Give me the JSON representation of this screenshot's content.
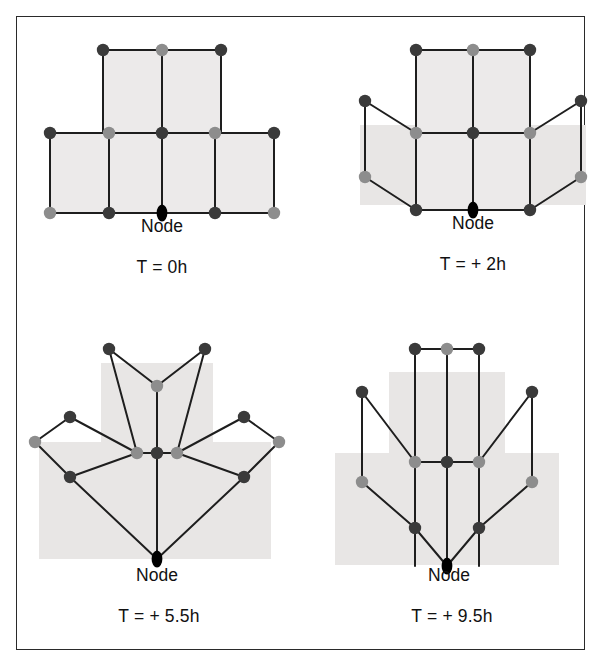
{
  "figure": {
    "border_color": "#2a2a2a",
    "background": "#ffffff"
  },
  "style": {
    "node_dark": "#3a3a3a",
    "node_light": "#8d8d8d",
    "node_black": "#000000",
    "edge_color": "#1e1e1e",
    "cell_fill": "#eceaea",
    "band_fill": "#e8e6e5",
    "node_radius": 6.2,
    "edge_width": 2.0
  },
  "panels": [
    {
      "id": "panel-t0",
      "caption": "T = 0h",
      "node_label": "Node",
      "origin_node": "n_origin",
      "faces": [
        {
          "name": "face-top-left",
          "points": "86,33 145,33 145,116 86,116"
        },
        {
          "name": "face-top-right",
          "points": "145,33 204,33 204,116 145,116"
        },
        {
          "name": "face-mid-left",
          "points": "33,116 92,116 92,196 33,196"
        },
        {
          "name": "face-mid-centerleft",
          "points": "92,116 145,116 145,196 92,196"
        },
        {
          "name": "face-mid-centerright",
          "points": "145,116 198,116 198,196 145,196"
        },
        {
          "name": "face-mid-right",
          "points": "198,116 257,116 257,196 198,196"
        }
      ],
      "bands": [],
      "edges": [
        [
          86,
          33,
          145,
          33
        ],
        [
          145,
          33,
          204,
          33
        ],
        [
          86,
          33,
          86,
          116
        ],
        [
          145,
          33,
          145,
          116
        ],
        [
          204,
          33,
          204,
          116
        ],
        [
          33,
          116,
          92,
          116
        ],
        [
          92,
          116,
          145,
          116
        ],
        [
          145,
          116,
          198,
          116
        ],
        [
          198,
          116,
          257,
          116
        ],
        [
          33,
          116,
          33,
          196
        ],
        [
          92,
          116,
          92,
          196
        ],
        [
          145,
          116,
          145,
          196
        ],
        [
          198,
          116,
          198,
          196
        ],
        [
          257,
          116,
          257,
          196
        ],
        [
          33,
          196,
          92,
          196
        ],
        [
          92,
          196,
          145,
          196
        ],
        [
          145,
          196,
          198,
          196
        ],
        [
          198,
          196,
          257,
          196
        ]
      ],
      "nodes": [
        {
          "x": 86,
          "y": 33,
          "tone": "dark"
        },
        {
          "x": 145,
          "y": 33,
          "tone": "light"
        },
        {
          "x": 204,
          "y": 33,
          "tone": "dark"
        },
        {
          "x": 33,
          "y": 116,
          "tone": "dark"
        },
        {
          "x": 92,
          "y": 116,
          "tone": "light"
        },
        {
          "x": 145,
          "y": 116,
          "tone": "dark"
        },
        {
          "x": 198,
          "y": 116,
          "tone": "light"
        },
        {
          "x": 257,
          "y": 116,
          "tone": "dark"
        },
        {
          "x": 33,
          "y": 196,
          "tone": "light"
        },
        {
          "x": 92,
          "y": 196,
          "tone": "dark"
        },
        {
          "x": 145,
          "y": 196,
          "tone": "black"
        },
        {
          "x": 198,
          "y": 196,
          "tone": "dark"
        },
        {
          "x": 257,
          "y": 196,
          "tone": "light"
        }
      ]
    },
    {
      "id": "panel-t2",
      "caption": "T = + 2h",
      "node_label": "Node",
      "origin_node": "n_origin",
      "faces": [
        {
          "name": "face-top-left",
          "points": "113,33 170,33 170,116 113,116"
        },
        {
          "name": "face-top-right",
          "points": "170,33 227,33 227,116 170,116"
        },
        {
          "name": "face-mid-left",
          "points": "113,116 170,116 170,193 113,193"
        },
        {
          "name": "face-mid-right",
          "points": "170,116 227,116 227,193 170,193"
        }
      ],
      "bands": [
        {
          "name": "band-lower",
          "x": 57,
          "y": 108,
          "w": 226,
          "h": 80
        }
      ],
      "edges": [
        [
          113,
          33,
          170,
          33
        ],
        [
          170,
          33,
          227,
          33
        ],
        [
          113,
          33,
          113,
          116
        ],
        [
          170,
          33,
          170,
          116
        ],
        [
          227,
          33,
          227,
          116
        ],
        [
          62,
          84,
          113,
          116
        ],
        [
          113,
          116,
          170,
          116
        ],
        [
          170,
          116,
          227,
          116
        ],
        [
          227,
          116,
          278,
          84
        ],
        [
          62,
          84,
          62,
          160
        ],
        [
          113,
          116,
          113,
          193
        ],
        [
          170,
          116,
          170,
          193
        ],
        [
          227,
          116,
          227,
          193
        ],
        [
          278,
          84,
          278,
          160
        ],
        [
          62,
          160,
          113,
          193
        ],
        [
          113,
          193,
          170,
          193
        ],
        [
          170,
          193,
          227,
          193
        ],
        [
          227,
          193,
          278,
          160
        ]
      ],
      "nodes": [
        {
          "x": 113,
          "y": 33,
          "tone": "dark"
        },
        {
          "x": 170,
          "y": 33,
          "tone": "light"
        },
        {
          "x": 227,
          "y": 33,
          "tone": "dark"
        },
        {
          "x": 62,
          "y": 84,
          "tone": "dark"
        },
        {
          "x": 113,
          "y": 116,
          "tone": "light"
        },
        {
          "x": 170,
          "y": 116,
          "tone": "dark"
        },
        {
          "x": 227,
          "y": 116,
          "tone": "light"
        },
        {
          "x": 278,
          "y": 84,
          "tone": "dark"
        },
        {
          "x": 62,
          "y": 160,
          "tone": "light"
        },
        {
          "x": 113,
          "y": 193,
          "tone": "dark"
        },
        {
          "x": 170,
          "y": 193,
          "tone": "black"
        },
        {
          "x": 227,
          "y": 193,
          "tone": "dark"
        },
        {
          "x": 278,
          "y": 160,
          "tone": "light"
        }
      ]
    },
    {
      "id": "panel-t55",
      "caption": "T = + 5.5h",
      "node_label": "Node",
      "origin_node": "n_origin",
      "faces": [],
      "bands": [
        {
          "name": "band-upper",
          "x": 84,
          "y": 36,
          "w": 112,
          "h": 90
        },
        {
          "name": "band-lower",
          "x": 22,
          "y": 115,
          "w": 232,
          "h": 117
        }
      ],
      "edges": [
        [
          92,
          22,
          140,
          59
        ],
        [
          140,
          59,
          188,
          22
        ],
        [
          92,
          22,
          120,
          126
        ],
        [
          188,
          22,
          160,
          126
        ],
        [
          140,
          59,
          140,
          126
        ],
        [
          53,
          90,
          120,
          126
        ],
        [
          120,
          126,
          140,
          126
        ],
        [
          140,
          126,
          160,
          126
        ],
        [
          160,
          126,
          227,
          90
        ],
        [
          53,
          90,
          18,
          115
        ],
        [
          227,
          90,
          262,
          115
        ],
        [
          18,
          115,
          53,
          150
        ],
        [
          262,
          115,
          227,
          150
        ],
        [
          53,
          150,
          120,
          126
        ],
        [
          227,
          150,
          160,
          126
        ],
        [
          53,
          150,
          140,
          232
        ],
        [
          227,
          150,
          140,
          232
        ],
        [
          140,
          126,
          140,
          232
        ]
      ],
      "nodes": [
        {
          "x": 92,
          "y": 22,
          "tone": "dark"
        },
        {
          "x": 188,
          "y": 22,
          "tone": "dark"
        },
        {
          "x": 140,
          "y": 59,
          "tone": "light"
        },
        {
          "x": 53,
          "y": 90,
          "tone": "dark"
        },
        {
          "x": 227,
          "y": 90,
          "tone": "dark"
        },
        {
          "x": 120,
          "y": 126,
          "tone": "light"
        },
        {
          "x": 140,
          "y": 126,
          "tone": "dark"
        },
        {
          "x": 160,
          "y": 126,
          "tone": "light"
        },
        {
          "x": 18,
          "y": 115,
          "tone": "light"
        },
        {
          "x": 262,
          "y": 115,
          "tone": "light"
        },
        {
          "x": 53,
          "y": 150,
          "tone": "dark"
        },
        {
          "x": 227,
          "y": 150,
          "tone": "dark"
        },
        {
          "x": 140,
          "y": 232,
          "tone": "black"
        }
      ]
    },
    {
      "id": "panel-t95",
      "caption": "T = + 9.5h",
      "node_label": "Node",
      "origin_node": "n_origin",
      "faces": [],
      "bands": [
        {
          "name": "band-upper",
          "x": 72,
          "y": 37,
          "w": 116,
          "h": 90
        },
        {
          "name": "band-lower",
          "x": 18,
          "y": 118,
          "w": 224,
          "h": 112
        }
      ],
      "edges": [
        [
          98,
          14,
          130,
          14
        ],
        [
          130,
          14,
          162,
          14
        ],
        [
          98,
          14,
          98,
          231
        ],
        [
          130,
          14,
          130,
          231
        ],
        [
          162,
          14,
          162,
          231
        ],
        [
          45,
          57,
          98,
          127
        ],
        [
          98,
          127,
          130,
          127
        ],
        [
          130,
          127,
          162,
          127
        ],
        [
          162,
          127,
          215,
          57
        ],
        [
          45,
          57,
          45,
          147
        ],
        [
          215,
          57,
          215,
          147
        ],
        [
          45,
          147,
          98,
          193
        ],
        [
          215,
          147,
          162,
          193
        ],
        [
          98,
          193,
          130,
          231
        ],
        [
          162,
          193,
          130,
          231
        ]
      ],
      "nodes": [
        {
          "x": 98,
          "y": 14,
          "tone": "dark"
        },
        {
          "x": 130,
          "y": 14,
          "tone": "light"
        },
        {
          "x": 162,
          "y": 14,
          "tone": "dark"
        },
        {
          "x": 45,
          "y": 57,
          "tone": "dark"
        },
        {
          "x": 215,
          "y": 57,
          "tone": "dark"
        },
        {
          "x": 98,
          "y": 127,
          "tone": "light"
        },
        {
          "x": 130,
          "y": 127,
          "tone": "dark"
        },
        {
          "x": 162,
          "y": 127,
          "tone": "light"
        },
        {
          "x": 45,
          "y": 147,
          "tone": "light"
        },
        {
          "x": 215,
          "y": 147,
          "tone": "light"
        },
        {
          "x": 98,
          "y": 193,
          "tone": "dark"
        },
        {
          "x": 162,
          "y": 193,
          "tone": "dark"
        },
        {
          "x": 130,
          "y": 231,
          "tone": "black"
        }
      ]
    }
  ]
}
